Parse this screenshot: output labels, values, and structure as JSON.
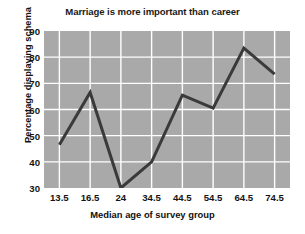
{
  "chart_data": {
    "type": "line",
    "title": "Marriage is more important than career",
    "xlabel": "Median age of survey group",
    "ylabel": "Percentage displaying schema",
    "categories": [
      "13.5",
      "16.5",
      "24",
      "34.5",
      "44.5",
      "54.5",
      "64.5",
      "74.5"
    ],
    "values": [
      46.5,
      66.5,
      30,
      40,
      65.5,
      60.5,
      83.5,
      73.5
    ],
    "ylim": [
      30,
      90
    ],
    "yticks": [
      30,
      40,
      50,
      60,
      70,
      80,
      90
    ],
    "ytick_labels": [
      "30",
      "40",
      "50",
      "60",
      "70",
      "80",
      "90"
    ],
    "grid": true,
    "grid_color": "#ffffff",
    "plot_background": "#a9a9a9",
    "line_color": "#3a3a3a",
    "line_width": 3,
    "legend": null,
    "legend_position": "none"
  }
}
